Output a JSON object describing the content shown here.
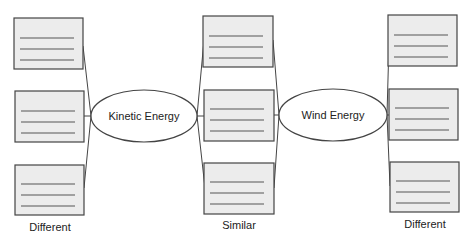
{
  "diagram": {
    "type": "double-bubble comparison organizer",
    "colors": {
      "box_fill": "#ececec",
      "box_stroke": "#444444",
      "line_stroke": "#444444",
      "ellipse_fill": "#ffffff",
      "text": "#222222"
    },
    "topics": [
      {
        "id": "kinetic",
        "label": "Kinetic Energy"
      },
      {
        "id": "wind",
        "label": "Wind Energy"
      }
    ],
    "columns": [
      {
        "id": "left",
        "label": "Different",
        "box_count": 3
      },
      {
        "id": "middle",
        "label": "Similar",
        "box_count": 3
      },
      {
        "id": "right",
        "label": "Different",
        "box_count": 3
      }
    ]
  }
}
